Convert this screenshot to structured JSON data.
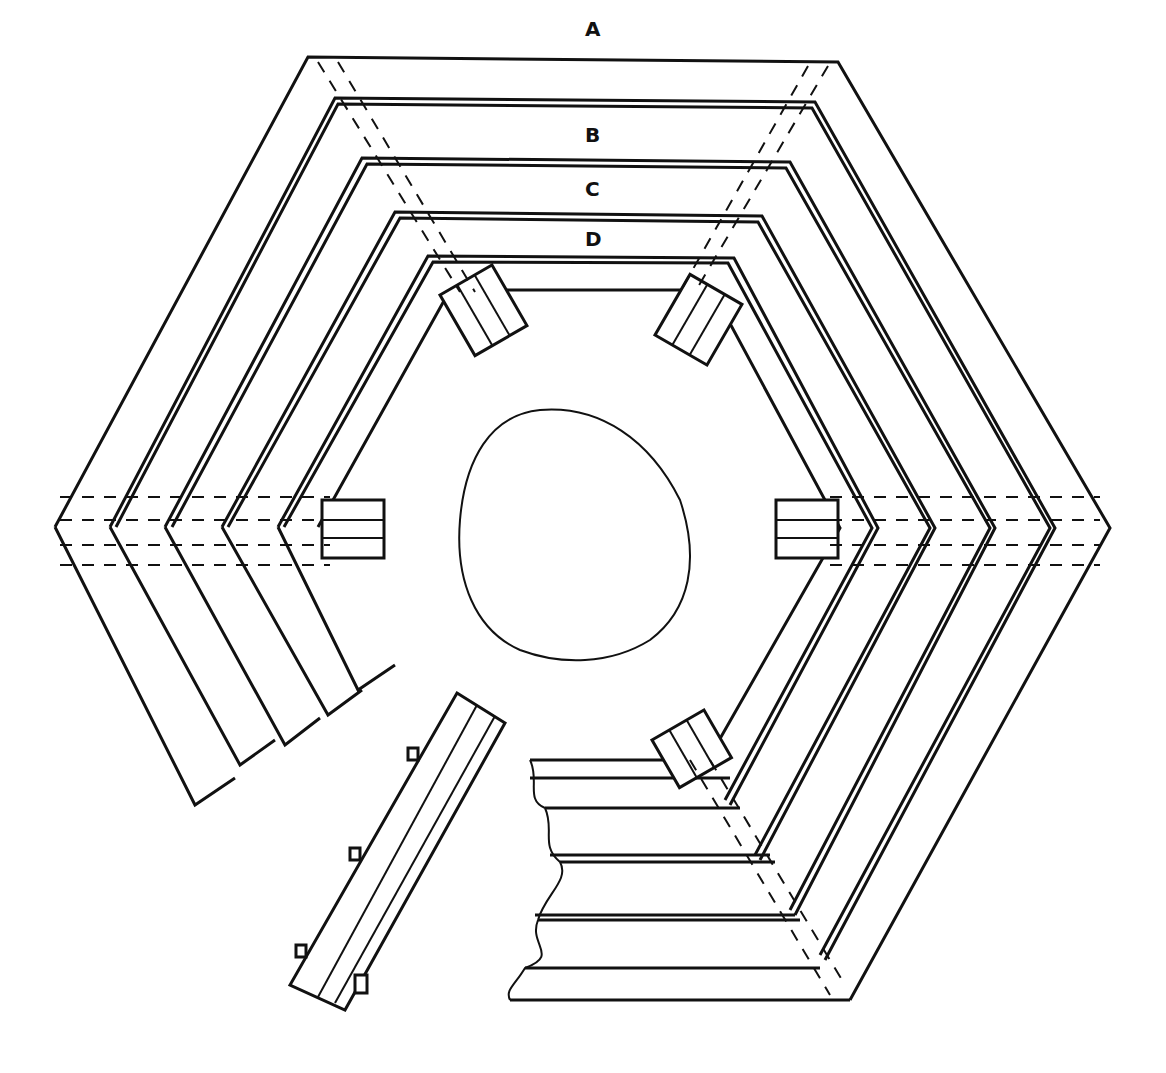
{
  "diagram": {
    "type": "hexagonal tree bench construction drawing",
    "labels": [
      {
        "id": "A",
        "x": 585,
        "y": 36
      },
      {
        "id": "B",
        "x": 585,
        "y": 142
      },
      {
        "id": "C",
        "x": 585,
        "y": 196
      },
      {
        "id": "D",
        "x": 585,
        "y": 246
      }
    ],
    "stroke_color": "#111111",
    "background": "#ffffff"
  }
}
